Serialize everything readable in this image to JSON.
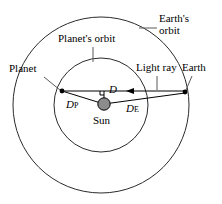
{
  "figure": {
    "background_color": "#ffffff",
    "stroke_color": "#000000",
    "sun_fill_color": "#8c8c8c"
  },
  "labels": {
    "earths_orbit_line1": "Earth's",
    "earths_orbit_line2": "orbit",
    "planets_orbit": "Planet's orbit",
    "planet": "Planet",
    "light_ray": "Light ray",
    "earth": "Earth",
    "sun": "Sun",
    "distance_planet": "D",
    "distance_planet_sub": "P",
    "distance_earth": "D",
    "distance_earth_sub": "E",
    "perpendicular_distance": "D"
  },
  "geometry": {
    "outer_circle": {
      "cx": 101,
      "cy": 105,
      "r": 88,
      "name": "earths-orbit"
    },
    "inner_circle": {
      "cx": 101,
      "cy": 105,
      "r": 47,
      "name": "planets-orbit"
    },
    "sun": {
      "cx": 104,
      "cy": 104,
      "r": 6
    },
    "planet_point": {
      "x": 62,
      "y": 92
    },
    "earth_point": {
      "x": 185,
      "y": 93
    },
    "ray_arrow": {
      "x": 131,
      "y": 91,
      "direction": "left"
    },
    "perpendicular_foot": {
      "x": 104,
      "y": 91
    }
  }
}
